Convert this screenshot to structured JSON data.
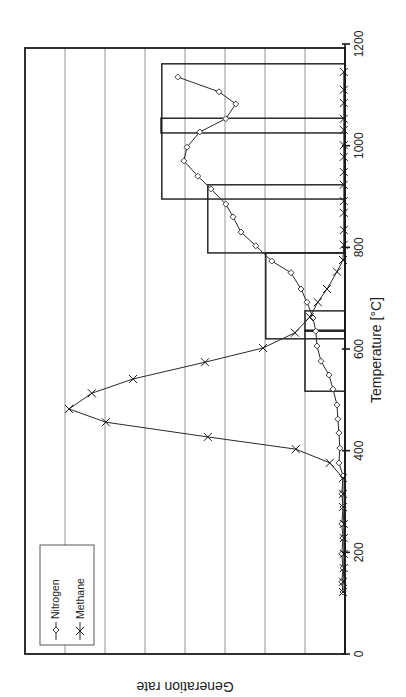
{
  "chart_data": {
    "type": "line",
    "orientation_note": "figure rotated 90 degrees counter-clockwise",
    "title": "",
    "xlabel": "Temperature [°C]",
    "ylabel": "Generation rate",
    "xlim": [
      0,
      1200
    ],
    "ylim": [
      0,
      8
    ],
    "x_ticks": [
      0,
      200,
      400,
      600,
      800,
      1000,
      1200
    ],
    "y_ticks": [],
    "grid": {
      "horizontal_gridlines_at": [
        1,
        2,
        3,
        4,
        5,
        6,
        7
      ],
      "on": true
    },
    "legend": {
      "position": "upper-left (rotated)",
      "entries": [
        "Nitrogen",
        "Methane"
      ]
    },
    "series": [
      {
        "name": "Nitrogen",
        "marker": "diamond",
        "x": [
          122,
          142,
          169,
          197,
          228,
          256,
          289,
          315,
          350,
          376,
          405,
          435,
          462,
          490,
          521,
          549,
          576,
          606,
          635,
          661,
          692,
          718,
          750,
          773,
          803,
          830,
          860,
          885,
          915,
          940,
          970,
          997,
          1027,
          1053,
          1082,
          1106,
          1135
        ],
        "values": [
          0.05,
          0.08,
          0.05,
          0.08,
          0.05,
          0.08,
          0.05,
          0.08,
          0.05,
          0.15,
          0.13,
          0.15,
          0.18,
          0.2,
          0.3,
          0.4,
          0.6,
          0.7,
          0.73,
          0.8,
          0.95,
          1.1,
          1.35,
          1.83,
          2.23,
          2.6,
          2.8,
          2.98,
          3.35,
          3.68,
          4.03,
          3.95,
          3.63,
          2.98,
          2.73,
          3.15,
          4.18
        ]
      },
      {
        "name": "Methane",
        "marker": "x",
        "x": [
          122,
          142,
          169,
          197,
          228,
          256,
          289,
          315,
          346,
          376,
          403,
          427,
          456,
          482,
          513,
          541,
          574,
          602,
          632,
          663,
          692,
          718,
          752,
          775,
          805,
          834,
          868,
          891,
          923,
          948,
          978,
          1001,
          1031,
          1053,
          1084,
          1110,
          1145
        ],
        "values": [
          0.05,
          0.05,
          0.03,
          0.03,
          0.03,
          0.03,
          0.05,
          0.05,
          0.05,
          0.38,
          1.23,
          3.43,
          5.98,
          6.9,
          6.33,
          5.3,
          3.5,
          2.05,
          1.25,
          0.88,
          0.68,
          0.45,
          0.2,
          0.05,
          0.03,
          0.03,
          0.03,
          0.03,
          0.03,
          0.03,
          0.03,
          0.03,
          0.03,
          0.03,
          0.03,
          0.03,
          0.03
        ]
      }
    ],
    "bars": [
      {
        "x_start": 517,
        "x_end": 637,
        "height": 1.0
      },
      {
        "x_start": 635,
        "x_end": 675,
        "height": 1.0
      },
      {
        "x_start": 620,
        "x_end": 789,
        "height": 1.98
      },
      {
        "x_start": 789,
        "x_end": 923,
        "height": 3.43
      },
      {
        "x_start": 895,
        "x_end": 1161,
        "height": 4.58
      },
      {
        "x_start": 1025,
        "x_end": 1054,
        "height": 4.6
      }
    ]
  },
  "labels": {
    "xlabel": "Temperature [°C]",
    "ylabel": "Generation rate",
    "legend_nitrogen": "Nitrogen",
    "legend_methane": "Methane"
  },
  "colors": {
    "line": "#2a2a2a",
    "grid": "#8a8a8a",
    "background": "#ffffff"
  }
}
